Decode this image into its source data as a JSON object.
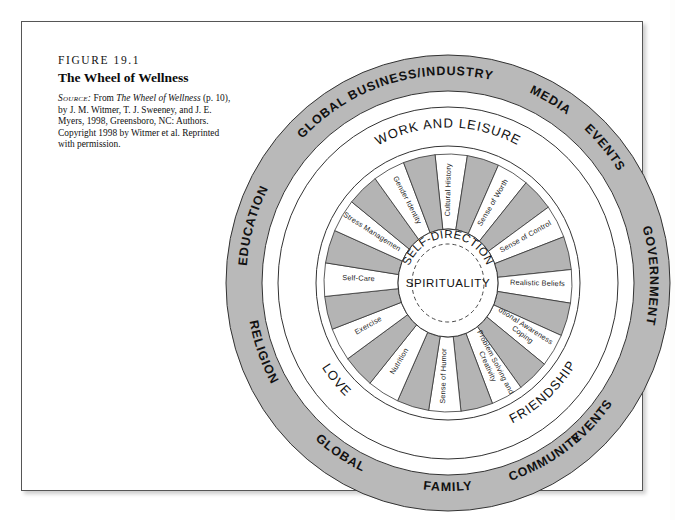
{
  "figure": {
    "number": "FIGURE 19.1",
    "title": "The Wheel of Wellness",
    "source_label": "Source:",
    "source_rest_1": " From ",
    "source_italic": "The Wheel of Wellness",
    "source_rest_2": " (p. 10), by J. M. Witmer, T. J. Sweeney, and J. E. Myers, 1998, Greensboro, NC: Authors. Copyright 1998 by Witmer et al. Reprinted with permission."
  },
  "colors": {
    "ring_gray": "#b9b9b9",
    "wedge_gray": "#b4b4b4",
    "stroke": "#333333",
    "white": "#ffffff",
    "text": "#111111",
    "frame": "#555555"
  },
  "diagram": {
    "center_inner_label": "SPIRITUALITY",
    "center_arc_label": "SELF-DIRECTION",
    "outer_ring": {
      "name": "life-forces-and-global-events-ring",
      "labels": [
        "GLOBAL",
        "BUSINESS/INDUSTRY",
        "MEDIA",
        "EVENTS",
        "GOVERNMENT",
        "EVENTS",
        "COMMUNITY",
        "FAMILY",
        "GLOBAL",
        "RELIGION",
        "EDUCATION"
      ]
    },
    "middle_ring": {
      "name": "life-tasks-ring",
      "labels": [
        "WORK AND LEISURE",
        "FRIENDSHIP",
        "LOVE"
      ]
    },
    "inner_wedges": {
      "name": "self-direction-subtasks",
      "labels": [
        "Cultural History",
        "Sense of Worth",
        "Sense of Control",
        "Realistic Beliefs",
        "Emotional Awareness and Coping",
        "Problem Solving and Creativity",
        "Sense of Humor",
        "Nutrition",
        "Exercise",
        "Self-Care",
        "Stress Management",
        "Gender Identity"
      ]
    }
  }
}
